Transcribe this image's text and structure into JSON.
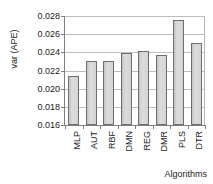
{
  "chart_data": {
    "type": "bar",
    "title": "",
    "xlabel": "Algorithms",
    "ylabel": "var (APE)",
    "categories": [
      "MLP",
      "AUT",
      "RBF",
      "DMN",
      "REG",
      "DMR",
      "PLS",
      "DTR"
    ],
    "values": [
      0.0214,
      0.023,
      0.0231,
      0.0239,
      0.0241,
      0.0237,
      0.0276,
      0.025
    ],
    "ylim": [
      0.016,
      0.028
    ],
    "yticks": [
      0.028,
      0.026,
      0.024,
      0.022,
      0.02,
      0.018,
      0.016
    ],
    "ytick_labels": [
      "0.028",
      "0.026",
      "0.024",
      "0.022",
      "0.020",
      "0.018",
      "0.016"
    ],
    "grid": true,
    "legend": "none",
    "bar_fill_color": "#d2d2d2",
    "bar_border_color": "#6e6e6e",
    "axis_color": "#808080",
    "gridline_color": "#bdbdbd",
    "text_color": "#1a1a1a",
    "background_color": "#ffffff"
  }
}
